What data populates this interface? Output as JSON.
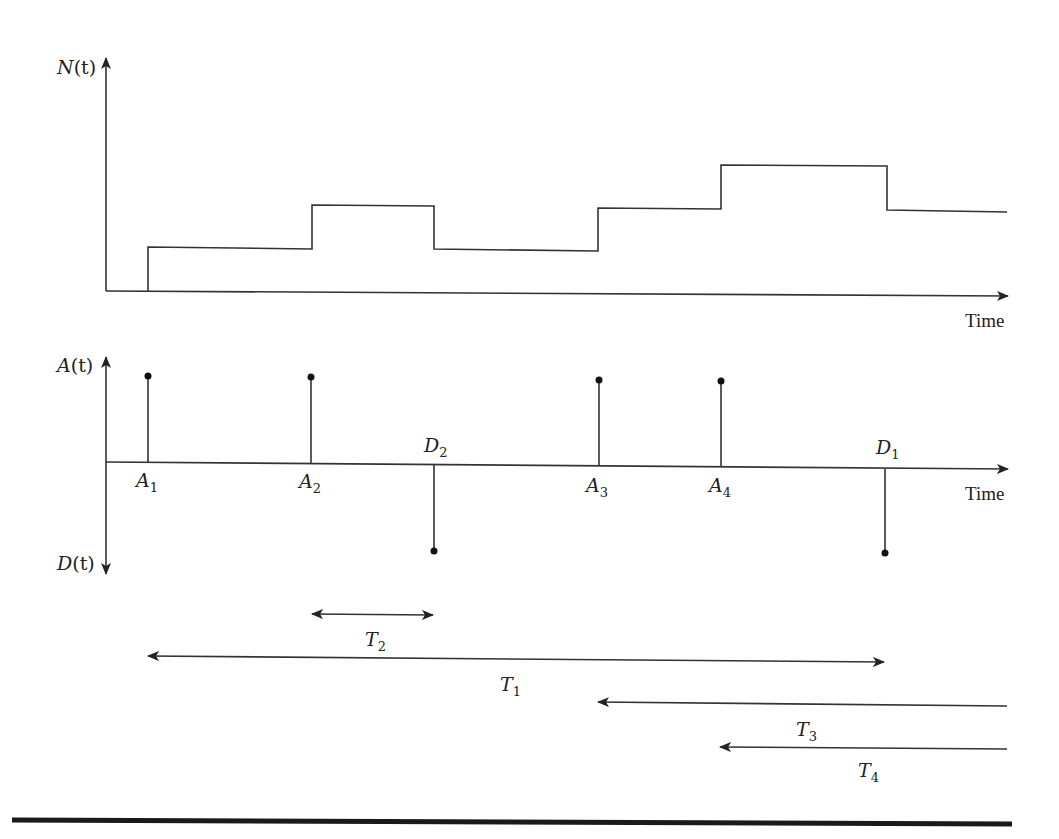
{
  "diagram": {
    "top_panel": {
      "y_label": "N(t)",
      "y_label_main": "N",
      "y_label_arg": "(t)",
      "x_label": "Time",
      "step_function": [
        {
          "x_start": 106,
          "x_end": 148,
          "level": 0
        },
        {
          "x_start": 148,
          "x_end": 312,
          "level": 1
        },
        {
          "x_start": 312,
          "x_end": 434,
          "level": 2
        },
        {
          "x_start": 434,
          "x_end": 598,
          "level": 1
        },
        {
          "x_start": 598,
          "x_end": 721,
          "level": 2
        },
        {
          "x_start": 721,
          "x_end": 887,
          "level": 3
        },
        {
          "x_start": 887,
          "x_end": 1007,
          "level": 2
        }
      ]
    },
    "bottom_panel": {
      "y_label_up": "A(t)",
      "y_label_up_main": "A",
      "y_label_up_arg": "(t)",
      "y_label_down": "D(t)",
      "y_label_down_main": "D",
      "y_label_down_arg": "(t)",
      "x_label": "Time",
      "arrivals": [
        {
          "name": "A",
          "sub": "1",
          "x": 148
        },
        {
          "name": "A",
          "sub": "2",
          "x": 311
        },
        {
          "name": "A",
          "sub": "3",
          "x": 599
        },
        {
          "name": "A",
          "sub": "4",
          "x": 721
        }
      ],
      "departures": [
        {
          "name": "D",
          "sub": "2",
          "x": 434
        },
        {
          "name": "D",
          "sub": "1",
          "x": 885
        }
      ]
    },
    "intervals": [
      {
        "name": "T",
        "sub": "2",
        "from": "A2",
        "to": "D2",
        "direction": "both"
      },
      {
        "name": "T",
        "sub": "1",
        "from": "A1",
        "to": "D1",
        "direction": "both"
      },
      {
        "name": "T",
        "sub": "3",
        "from": "A3",
        "to": "end",
        "direction": "left"
      },
      {
        "name": "T",
        "sub": "4",
        "from": "A4",
        "to": "end",
        "direction": "left"
      }
    ],
    "colors": {
      "line": "#333333",
      "background": "#ffffff",
      "rule": "#1a1a1a"
    }
  }
}
